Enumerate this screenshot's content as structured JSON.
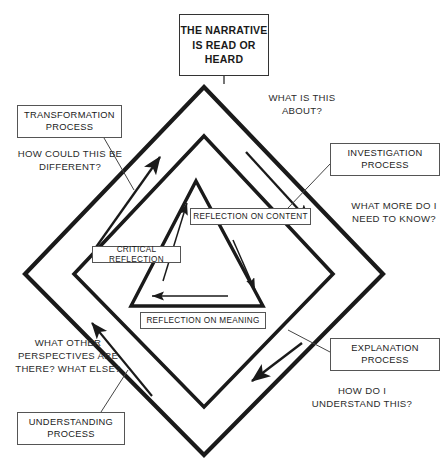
{
  "diagram": {
    "center_box": {
      "text": "THE NARRATIVE IS READ OR HEARD",
      "lines": [
        "THE",
        "NARRATIVE IS",
        "READ OR",
        "HEARD"
      ]
    },
    "process_boxes": [
      {
        "id": "transformation",
        "label": "TRANSFORMATION PROCESS",
        "position": "top-left"
      },
      {
        "id": "investigation",
        "label": "INVESTIGATION PROCESS",
        "position": "top-right"
      },
      {
        "id": "explanation",
        "label": "EXPLANATION PROCESS",
        "position": "bottom-right"
      },
      {
        "id": "understanding",
        "label": "UNDERSTANDING PROCESS",
        "position": "bottom-left"
      }
    ],
    "questions": [
      {
        "id": "about",
        "text": "WHAT IS THIS ABOUT?",
        "position": "top-right"
      },
      {
        "id": "know",
        "text": "WHAT MORE DO I NEED TO KNOW?",
        "position": "right"
      },
      {
        "id": "understand",
        "text": "HOW DO I UNDERSTAND THIS?",
        "position": "bottom-right"
      },
      {
        "id": "perspectives",
        "text": "WHAT OTHER PERSPECTIVES ARE THERE? WHAT ELSE?",
        "position": "bottom-left"
      },
      {
        "id": "different",
        "text": "HOW COULD THIS BE DIFFERENT?",
        "position": "top-left"
      }
    ],
    "inner_labels": [
      {
        "id": "reflection-on-content",
        "label": "REFLECTION ON CONTENT",
        "position": "upper-right"
      },
      {
        "id": "critical-reflection",
        "label": "CRITICAL REFLECTION",
        "position": "upper-left"
      },
      {
        "id": "reflection-on-meaning",
        "label": "REFLECTION ON MEANING",
        "position": "bottom"
      }
    ],
    "colors": {
      "stroke": "#1a1a1a",
      "background": "#ffffff",
      "box_border": "#555555",
      "text": "#1a1a1a"
    },
    "shapes": {
      "outer_diamond": "thick diamond, vertices top (204,87) right (383,274) bottom (204,455) left (25,274)",
      "middle_diamond": "thick diamond, vertices top (204,136) right (333,274) bottom (204,407) left (74,274)",
      "inner_triangle": "thick triangle, apex (196,181) bottom-left (131,306) bottom-right (263,306)"
    },
    "arrows": {
      "outer_cycle": "counter-clockwise flow between the four process stages",
      "inner_cycle": "counter-clockwise flow around the reflection triangle"
    }
  }
}
